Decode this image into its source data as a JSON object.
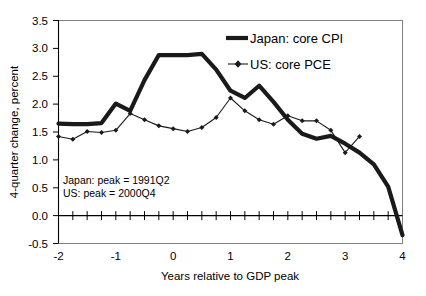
{
  "chart_data": {
    "type": "line",
    "title": "",
    "xlabel": "Years relative to GDP peak",
    "ylabel": "4-quarter change, percent",
    "xlim": [
      -2,
      4
    ],
    "ylim": [
      -0.5,
      3.5
    ],
    "xticks": [
      -2,
      -1,
      0,
      1,
      2,
      3,
      4
    ],
    "xtick_labels": [
      "-2",
      "-1",
      "0",
      "1",
      "2",
      "3",
      "4"
    ],
    "yticks": [
      -0.5,
      0.0,
      0.5,
      1.0,
      1.5,
      2.0,
      2.5,
      3.0,
      3.5
    ],
    "ytick_labels": [
      "-0.5",
      "0.0",
      "0.5",
      "1.0",
      "1.5",
      "2.0",
      "2.5",
      "3.0",
      "3.5"
    ],
    "minor_xtick_interval": 0.25,
    "grid": false,
    "legend_position": "top-right",
    "zero_line": true,
    "series": [
      {
        "name": "Japan: core CPI",
        "style": "thick-line",
        "marker": "none",
        "color": "#1a1a1a",
        "x": [
          -2.0,
          -1.75,
          -1.5,
          -1.25,
          -1.0,
          -0.75,
          -0.5,
          -0.25,
          0.0,
          0.25,
          0.5,
          0.75,
          1.0,
          1.25,
          1.5,
          1.75,
          2.0,
          2.25,
          2.5,
          2.75,
          3.0,
          3.25,
          3.5,
          3.75,
          4.0
        ],
        "y": [
          1.65,
          1.64,
          1.64,
          1.66,
          2.01,
          1.88,
          2.43,
          2.88,
          2.88,
          2.88,
          2.9,
          2.62,
          2.24,
          2.11,
          2.33,
          2.04,
          1.72,
          1.47,
          1.38,
          1.43,
          1.29,
          1.13,
          0.92,
          0.52,
          -0.35
        ]
      },
      {
        "name": "US: core PCE",
        "style": "thin-line",
        "marker": "diamond",
        "color": "#1a1a1a",
        "x": [
          -2.0,
          -1.75,
          -1.5,
          -1.25,
          -1.0,
          -0.75,
          -0.5,
          -0.25,
          0.0,
          0.25,
          0.5,
          0.75,
          1.0,
          1.25,
          1.5,
          1.75,
          2.0,
          2.25,
          2.5,
          2.75,
          3.0,
          3.25
        ],
        "y": [
          1.42,
          1.37,
          1.51,
          1.49,
          1.53,
          1.83,
          1.72,
          1.61,
          1.56,
          1.51,
          1.58,
          1.76,
          2.11,
          1.88,
          1.72,
          1.64,
          1.79,
          1.7,
          1.7,
          1.53,
          1.13,
          1.42
        ]
      }
    ],
    "annotations": [
      {
        "text": "Japan: peak = 1991Q2",
        "x": -1.75,
        "y": 0.72
      },
      {
        "text": "US: peak = 2000Q4",
        "x": -1.75,
        "y": 0.53
      }
    ]
  },
  "legend": {
    "items": [
      {
        "label": "Japan: core CPI"
      },
      {
        "label": "US: core PCE"
      }
    ]
  }
}
